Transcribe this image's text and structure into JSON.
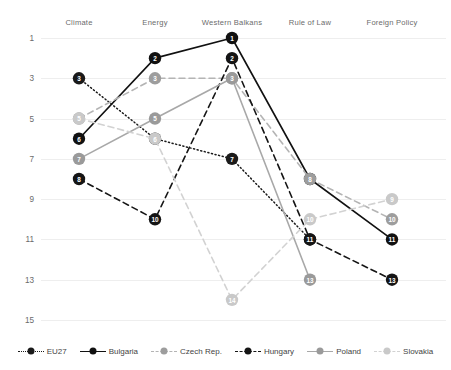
{
  "chart_data": {
    "type": "line",
    "title": "",
    "xlabel": "",
    "ylabel": "",
    "categories": [
      "Climate",
      "Energy",
      "Western Balkans",
      "Rule of Law",
      "Foreign Policy"
    ],
    "yticks": [
      1,
      3,
      5,
      7,
      9,
      11,
      13,
      15
    ],
    "ylim": [
      1,
      15
    ],
    "y_inverted": true,
    "grid": true,
    "legend_position": "bottom",
    "note": "Rank chart: rank 1 at top (best), rank 15 at bottom",
    "series": [
      {
        "name": "EU27",
        "color": "#1a1a1a",
        "line_style": "dotted",
        "marker_color": "#1a1a1a",
        "label_color": "#ffffff",
        "values": [
          3,
          6,
          7,
          11,
          null
        ]
      },
      {
        "name": "Bulgaria",
        "color": "#111111",
        "line_style": "solid",
        "marker_color": "#111111",
        "label_color": "#ffffff",
        "values": [
          6,
          2,
          1,
          8,
          11
        ]
      },
      {
        "name": "Czech Rep.",
        "color": "#b4b4b4",
        "line_style": "dashed",
        "marker_color": "#9d9d9d",
        "label_color": "#ffffff",
        "values": [
          5,
          3,
          3,
          8,
          10
        ]
      },
      {
        "name": "Hungary",
        "color": "#151515",
        "line_style": "dashed",
        "marker_color": "#151515",
        "label_color": "#ffffff",
        "values": [
          8,
          10,
          2,
          11,
          13
        ]
      },
      {
        "name": "Poland",
        "color": "#a8a8a8",
        "line_style": "solid",
        "marker_color": "#9a9a9a",
        "label_color": "#ffffff",
        "values": [
          7,
          5,
          3,
          13,
          null
        ]
      },
      {
        "name": "Slovakia",
        "color": "#d2d2d2",
        "line_style": "dashed",
        "marker_color": "#c9c9c9",
        "label_color": "#ffffff",
        "values": [
          5,
          6,
          14,
          10,
          9
        ]
      }
    ]
  },
  "legend": {
    "items": [
      {
        "label": "EU27"
      },
      {
        "label": "Bulgaria"
      },
      {
        "label": "Czech Rep."
      },
      {
        "label": "Hungary"
      },
      {
        "label": "Poland"
      },
      {
        "label": "Slovakia"
      }
    ]
  }
}
